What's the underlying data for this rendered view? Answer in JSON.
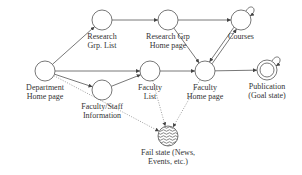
{
  "diagram": {
    "nodes": [
      {
        "id": "dept",
        "label": [
          "Department",
          "Home page"
        ],
        "x": 45,
        "y": 71,
        "type": "start"
      },
      {
        "id": "rgl",
        "label": [
          "Research",
          "Grp. List"
        ],
        "x": 102,
        "y": 20,
        "type": "state"
      },
      {
        "id": "rgh",
        "label": [
          "Research Grp",
          "Home page"
        ],
        "x": 168,
        "y": 20,
        "type": "state"
      },
      {
        "id": "courses",
        "label": [
          "Courses"
        ],
        "x": 241,
        "y": 20,
        "type": "state",
        "self_loop": true
      },
      {
        "id": "fsi",
        "label": [
          "Faculty/Staff",
          "Information"
        ],
        "x": 102,
        "y": 90,
        "type": "state"
      },
      {
        "id": "fl",
        "label": [
          "Faculty",
          "List"
        ],
        "x": 150,
        "y": 71,
        "type": "state"
      },
      {
        "id": "fh",
        "label": [
          "Faculty",
          "Home page"
        ],
        "x": 205,
        "y": 71,
        "type": "state"
      },
      {
        "id": "pub",
        "label": [
          "Publication",
          "(Goal state)"
        ],
        "x": 267,
        "y": 70,
        "type": "goal",
        "self_loop": true
      },
      {
        "id": "fail",
        "label": [
          "Fail state (News,",
          "Events, etc.)"
        ],
        "x": 168,
        "y": 136,
        "type": "fail"
      }
    ],
    "edges": [
      {
        "from": "dept",
        "to": "rgl",
        "style": "solid"
      },
      {
        "from": "dept",
        "to": "fl",
        "style": "solid"
      },
      {
        "from": "dept",
        "to": "fsi",
        "style": "solid"
      },
      {
        "from": "rgl",
        "to": "rgh",
        "style": "solid"
      },
      {
        "from": "rgh",
        "to": "courses",
        "style": "solid"
      },
      {
        "from": "rgh",
        "to": "fh",
        "style": "solid"
      },
      {
        "from": "fsi",
        "to": "fl",
        "style": "solid"
      },
      {
        "from": "fl",
        "to": "fh",
        "style": "solid"
      },
      {
        "from": "fh",
        "to": "courses",
        "style": "solid"
      },
      {
        "from": "courses",
        "to": "fh",
        "style": "solid"
      },
      {
        "from": "fh",
        "to": "pub",
        "style": "solid"
      },
      {
        "from": "dept",
        "to": "fail",
        "style": "dotted"
      },
      {
        "from": "fl",
        "to": "fail",
        "style": "dotted"
      },
      {
        "from": "fh",
        "to": "fail",
        "style": "dotted"
      }
    ]
  }
}
